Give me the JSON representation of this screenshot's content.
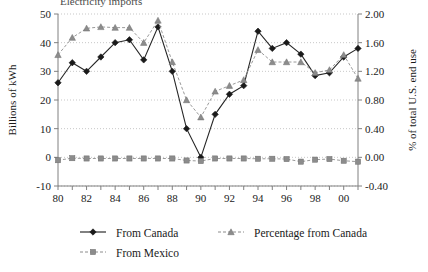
{
  "chart_data": {
    "type": "line",
    "title": "",
    "xlabel": "",
    "ylabel": "Billions of kWh",
    "y2label": "% of total U.S. end use",
    "grid": true,
    "legend_position": "bottom",
    "x": [
      "80",
      "81",
      "82",
      "83",
      "84",
      "85",
      "86",
      "87",
      "88",
      "89",
      "90",
      "91",
      "92",
      "93",
      "94",
      "95",
      "96",
      "97",
      "98",
      "99",
      "00",
      "01"
    ],
    "xtick_labels": [
      "80",
      "",
      "82",
      "",
      "84",
      "",
      "86",
      "",
      "88",
      "",
      "90",
      "",
      "92",
      "",
      "94",
      "",
      "96",
      "",
      "98",
      "",
      "00",
      ""
    ],
    "ylim": [
      -10,
      50
    ],
    "yticks": [
      "-10",
      "0",
      "10",
      "20",
      "30",
      "40",
      "50"
    ],
    "y2lim": [
      -0.4,
      2.0
    ],
    "y2ticks": [
      "-0.40",
      "0.00",
      "0.40",
      "0.80",
      "1.20",
      "1.60",
      "2.00"
    ],
    "series": [
      {
        "name": "From Canada",
        "axis": "left",
        "marker": "diamond",
        "color": "#1a1a1a",
        "values": [
          26.0,
          33.0,
          30.0,
          35.0,
          40.0,
          41.0,
          34.0,
          45.5,
          30.0,
          10.0,
          0.0,
          15.0,
          22.0,
          25.0,
          44.0,
          38.0,
          40.0,
          36.0,
          28.5,
          29.5,
          35.0,
          38.0
        ]
      },
      {
        "name": "Percentage from Canada",
        "axis": "right",
        "marker": "triangle",
        "color": "#8c8c8c",
        "values": [
          1.43,
          1.67,
          1.8,
          1.82,
          1.81,
          1.81,
          1.6,
          1.91,
          1.33,
          0.8,
          0.56,
          0.92,
          1.0,
          1.08,
          1.5,
          1.33,
          1.33,
          1.33,
          1.18,
          1.22,
          1.43,
          1.1
        ]
      },
      {
        "name": "From Mexico",
        "axis": "left",
        "marker": "square",
        "color": "#8c8c8c",
        "values": [
          -1.0,
          -0.3,
          -0.4,
          -0.4,
          -0.4,
          -0.4,
          -0.4,
          -0.4,
          -0.4,
          -1.1,
          -1.3,
          -0.4,
          -0.4,
          -0.4,
          -0.5,
          -0.5,
          -0.6,
          -1.5,
          -0.8,
          -0.6,
          -1.2,
          -1.5
        ]
      }
    ],
    "legend": [
      {
        "label": "From Canada",
        "marker": "diamond",
        "color": "#1a1a1a",
        "dashed": false
      },
      {
        "label": "Percentage from Canada",
        "marker": "triangle",
        "color": "#8c8c8c",
        "dashed": true
      },
      {
        "label": "From Mexico",
        "marker": "square",
        "color": "#8c8c8c",
        "dashed": true
      }
    ]
  },
  "cropped_caption": "Electricity imports"
}
